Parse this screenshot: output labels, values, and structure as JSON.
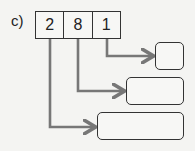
{
  "label": "c)",
  "digits": [
    "2",
    "8",
    "1"
  ],
  "answer_boxes": [
    {
      "value": ""
    },
    {
      "value": ""
    },
    {
      "value": ""
    }
  ],
  "colors": {
    "arrow": "#777777",
    "border": "#333333"
  }
}
